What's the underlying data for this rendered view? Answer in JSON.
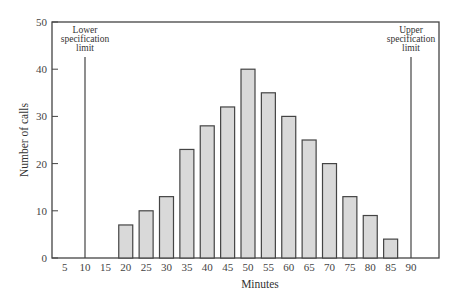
{
  "chart_data": {
    "type": "bar",
    "title": "",
    "xlabel": "Minutes",
    "ylabel": "Number of calls",
    "categories": [
      "5",
      "10",
      "15",
      "20",
      "25",
      "30",
      "35",
      "40",
      "45",
      "50",
      "55",
      "60",
      "65",
      "70",
      "75",
      "80",
      "85",
      "90"
    ],
    "x": [
      5,
      10,
      15,
      20,
      25,
      30,
      35,
      40,
      45,
      50,
      55,
      60,
      65,
      70,
      75,
      80,
      85,
      90
    ],
    "values": [
      0,
      0,
      0,
      7,
      10,
      13,
      23,
      28,
      32,
      40,
      35,
      30,
      25,
      20,
      13,
      9,
      4,
      0
    ],
    "ylim": [
      0,
      50
    ],
    "yticks": [
      0,
      10,
      20,
      30,
      40,
      50
    ],
    "grid": false,
    "legend": null,
    "annotations": [
      {
        "text": [
          "Lower",
          "specification",
          "limit"
        ],
        "x": 10,
        "type": "vertical-line"
      },
      {
        "text": [
          "Upper",
          "specification",
          "limit"
        ],
        "x": 90,
        "type": "vertical-line"
      }
    ],
    "colors": {
      "bar_fill": "#d9d9d9",
      "bar_stroke": "#444444",
      "axis": "#444444"
    }
  }
}
